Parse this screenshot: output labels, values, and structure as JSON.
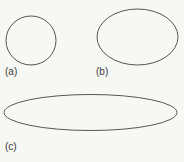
{
  "figure": {
    "background": "#f7f7f5",
    "stroke_color": "#555555",
    "panels": [
      {
        "id": "a",
        "label": "(a)",
        "shape": "circle",
        "cx": 31,
        "cy": 40.5,
        "rx": 25,
        "ry": 24.5
      },
      {
        "id": "b",
        "label": "(b)",
        "shape": "ellipse",
        "cx": 137.5,
        "cy": 37,
        "rx": 40.5,
        "ry": 28
      },
      {
        "id": "c",
        "label": "(c)",
        "shape": "ellipse",
        "cx": 90.5,
        "cy": 112.5,
        "rx": 86.5,
        "ry": 18
      }
    ]
  }
}
